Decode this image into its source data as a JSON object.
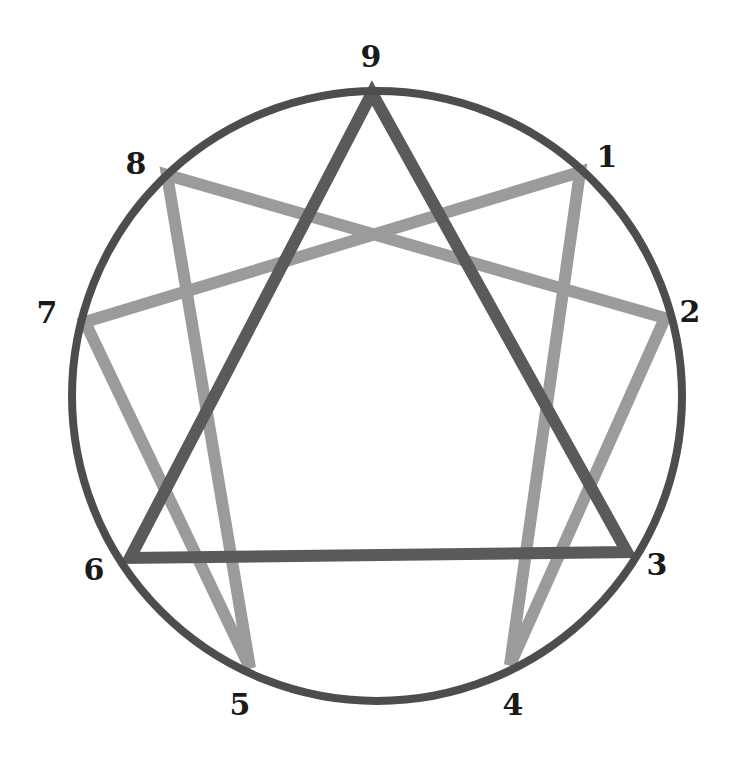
{
  "diagram": {
    "type": "enneagram",
    "colors": {
      "background": "#ffffff",
      "circle": "#4d4d4d",
      "triangle": "#5a5a5a",
      "hexad": "#9b9b9b",
      "label": "#1a1a1a"
    },
    "circle": {
      "cx": 377,
      "cy": 396,
      "r": 305,
      "stroke_width": 8
    },
    "points": [
      {
        "id": "9",
        "label": "9",
        "x": 372,
        "y": 93,
        "label_x": 371,
        "label_y": 57
      },
      {
        "id": "1",
        "label": "1",
        "x": 580,
        "y": 172,
        "label_x": 607,
        "label_y": 157
      },
      {
        "id": "2",
        "label": "2",
        "x": 665,
        "y": 318,
        "label_x": 690,
        "label_y": 312
      },
      {
        "id": "3",
        "label": "3",
        "x": 627,
        "y": 552,
        "label_x": 657,
        "label_y": 565
      },
      {
        "id": "4",
        "label": "4",
        "x": 510,
        "y": 665,
        "label_x": 513,
        "label_y": 705
      },
      {
        "id": "5",
        "label": "5",
        "x": 250,
        "y": 668,
        "label_x": 240,
        "label_y": 705
      },
      {
        "id": "6",
        "label": "6",
        "x": 130,
        "y": 558,
        "label_x": 94,
        "label_y": 570
      },
      {
        "id": "7",
        "label": "7",
        "x": 85,
        "y": 322,
        "label_x": 47,
        "label_y": 313
      },
      {
        "id": "8",
        "label": "8",
        "x": 167,
        "y": 175,
        "label_x": 136,
        "label_y": 164
      }
    ],
    "triangle": {
      "name": "inner triangle",
      "sequence": [
        "9",
        "3",
        "6"
      ],
      "closed": true,
      "stroke_width": 12
    },
    "hexad": {
      "name": "hexad",
      "sequence": [
        "1",
        "4",
        "2",
        "8",
        "5",
        "7"
      ],
      "closed": true,
      "stroke_width": 12
    }
  }
}
